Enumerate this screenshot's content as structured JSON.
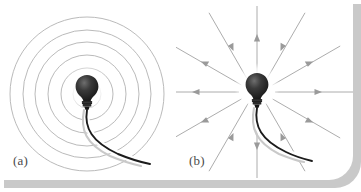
{
  "figure": {
    "background_color": "#ffffff",
    "card_color": "#ffffff",
    "shadow_color": "#c9c9c9",
    "line_color": "#a8a8a8",
    "arrow_color": "#9a9a9a",
    "cord_color": "#1a1a1a",
    "cord_shadow_color": "#c4c4c4",
    "bulb_color": "#1c1c1c",
    "glow_color": "#ffffff",
    "width": 361,
    "height": 192
  },
  "panels": [
    {
      "id": "panel-a",
      "label": "(a)",
      "representation": "wavefronts",
      "description": "Light bulb emitting concentric circular wavefronts",
      "bulb": {
        "cx": 87,
        "cy": 94,
        "glow_radius": 22
      },
      "wavefront_radii": [
        14,
        26,
        39,
        52,
        64,
        77
      ],
      "wavefront_count": 6,
      "cord": {
        "start_x": 87,
        "start_y": 110,
        "end_x": 150,
        "end_y": 163
      }
    },
    {
      "id": "panel-b",
      "label": "(b)",
      "representation": "rays",
      "description": "Light bulb emitting straight outward-pointing light rays",
      "bulb": {
        "cx": 81,
        "cy": 92,
        "glow_radius": 22
      },
      "ray_count": 12,
      "ray_angles_deg": [
        0,
        30,
        60,
        90,
        120,
        150,
        180,
        210,
        240,
        270,
        300,
        330
      ],
      "ray_inner_radius": 18,
      "ray_outer_radius": 96,
      "arrowhead_radius": 58,
      "arrow_direction": "outward",
      "cord": {
        "start_x": 81,
        "start_y": 108,
        "end_x": 140,
        "end_y": 160
      }
    }
  ]
}
